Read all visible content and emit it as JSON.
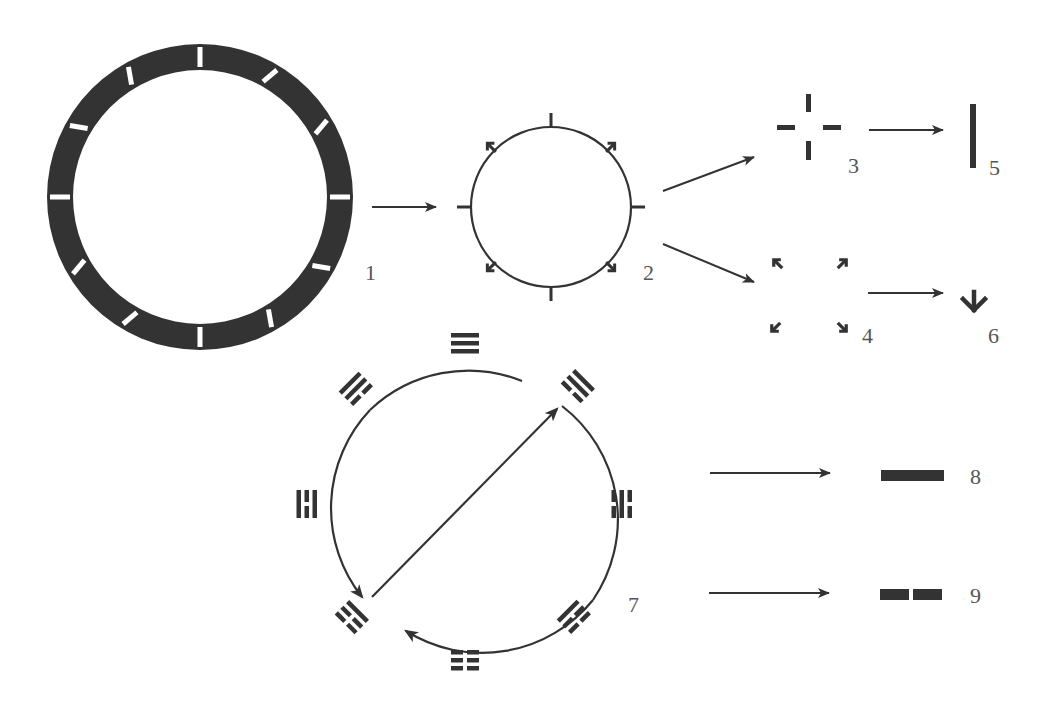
{
  "colors": {
    "ink": "#333333",
    "ring": "#333333",
    "tick": "#ffffff",
    "label": "#555555",
    "bg": "#ffffff"
  },
  "figures": [
    {
      "id": 1,
      "label": "1",
      "kind": "bezel-ring",
      "label_pos": [
        365,
        280
      ],
      "cx": 200,
      "cy": 197,
      "outer_r": 153,
      "inner_r": 127,
      "ticks_deg": [
        0,
        30,
        60,
        90,
        120,
        150,
        180,
        210,
        240,
        270,
        300,
        330
      ]
    },
    {
      "id": 2,
      "label": "2",
      "kind": "circle-with-markers",
      "label_pos": [
        643,
        280
      ],
      "cx": 551,
      "cy": 207,
      "r": 80
    },
    {
      "id": 3,
      "label": "3",
      "kind": "cross-dashes",
      "label_pos": [
        848,
        173
      ]
    },
    {
      "id": 4,
      "label": "4",
      "kind": "four-inward-arrows",
      "label_pos": [
        862,
        343
      ]
    },
    {
      "id": 5,
      "label": "5",
      "kind": "vertical-bar",
      "label_pos": [
        989,
        175
      ]
    },
    {
      "id": 6,
      "label": "6",
      "kind": "down-arrow",
      "label_pos": [
        988,
        343
      ]
    },
    {
      "id": 7,
      "label": "7",
      "kind": "trigram-circle",
      "label_pos": [
        628,
        612
      ],
      "cx": 462,
      "cy": 522,
      "r": 143,
      "trigrams": [
        {
          "position": "top",
          "lines": [
            "yang",
            "yang",
            "yang"
          ]
        },
        {
          "position": "upper-right",
          "lines": [
            "yang",
            "yang",
            "yin"
          ]
        },
        {
          "position": "right",
          "lines": [
            "yin",
            "yang",
            "yin"
          ]
        },
        {
          "position": "lower-right",
          "lines": [
            "yin",
            "yin",
            "yang"
          ]
        },
        {
          "position": "bottom",
          "lines": [
            "yin",
            "yin",
            "yin"
          ]
        },
        {
          "position": "lower-left",
          "lines": [
            "yang",
            "yin",
            "yin"
          ]
        },
        {
          "position": "left",
          "lines": [
            "yang",
            "yin",
            "yang"
          ]
        },
        {
          "position": "upper-left",
          "lines": [
            "yin",
            "yang",
            "yang"
          ]
        }
      ]
    },
    {
      "id": 8,
      "label": "8",
      "kind": "solid-line-yang",
      "label_pos": [
        970,
        484
      ]
    },
    {
      "id": 9,
      "label": "9",
      "kind": "broken-line-yin",
      "label_pos": [
        970,
        603
      ]
    }
  ],
  "arrows": [
    {
      "from": "1",
      "to": "2",
      "x1": 372,
      "y1": 207,
      "x2": 436,
      "y2": 207
    },
    {
      "from": "2",
      "to": "3",
      "x1": 663,
      "y1": 191,
      "x2": 754,
      "y2": 157
    },
    {
      "from": "2",
      "to": "4",
      "x1": 663,
      "y1": 244,
      "x2": 754,
      "y2": 282
    },
    {
      "from": "3",
      "to": "5",
      "x1": 869,
      "y1": 130,
      "x2": 943,
      "y2": 130
    },
    {
      "from": "4",
      "to": "6",
      "x1": 868,
      "y1": 293,
      "x2": 943,
      "y2": 293
    },
    {
      "from": "7",
      "to": "8",
      "x1": 710,
      "y1": 473,
      "x2": 830,
      "y2": 473
    },
    {
      "from": "7",
      "to": "9",
      "x1": 709,
      "y1": 593,
      "x2": 829,
      "y2": 593
    }
  ]
}
